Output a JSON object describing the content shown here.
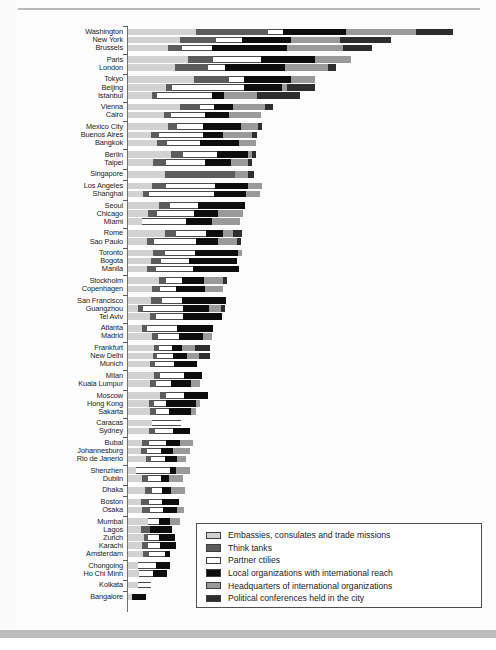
{
  "chart_data": {
    "type": "bar",
    "orientation": "horizontal",
    "stacked": true,
    "title": "",
    "subtitle": "",
    "xlabel": "",
    "ylabel": "",
    "grid": false,
    "axis_ticks_visible": false,
    "legend_position": "bottom-right",
    "series": [
      {
        "name": "Embassies, consulates and trade missions",
        "key": "s0",
        "color": "#d2d2d2"
      },
      {
        "name": "Think tanks",
        "key": "s1",
        "color": "#5c5c5c"
      },
      {
        "name": "Partner ctilies",
        "key": "s2",
        "color": "#ffffff"
      },
      {
        "name": "Local organizations with international reach",
        "key": "s3",
        "color": "#0d0d0d"
      },
      {
        "name": "Headquarters of international organizations",
        "key": "s4",
        "color": "#9a9a9a"
      },
      {
        "name": "Political conferences held in the city",
        "key": "s5",
        "color": "#2e2e2e"
      }
    ],
    "categories": [
      "Washington",
      "New York",
      "Brussels",
      "Paris",
      "London",
      "Tokyo",
      "Beijing",
      "Istanbul",
      "Vienna",
      "Cairo",
      "Mexico City",
      "Buenos Aires",
      "Bangkok",
      "Berlin",
      "Taipei",
      "Singapore",
      "Los Angeles",
      "Shanghai",
      "Seoul",
      "Chicago",
      "Miami",
      "Rome",
      "Sao Paulo",
      "Toronto",
      "Bogota",
      "Manila",
      "Stockholm",
      "Copenhagen",
      "San Francisco",
      "Guangzhou",
      "Tel Aviv",
      "Atlanta",
      "Madrid",
      "Frankfurt",
      "New Delhi",
      "Munich",
      "Milan",
      "Kuala Lumpur",
      "Moscow",
      "Hong Kong",
      "Sakarta",
      "Caracas",
      "Sydney",
      "Bubal",
      "Johannesburg",
      "Rio de Janerio",
      "Shenzhen",
      "Dublin",
      "Dhaka",
      "Boston",
      "Osaka",
      "Mumbai",
      "Lagos",
      "Zurich",
      "Karachi",
      "Amsterdam",
      "Chongoing",
      "Ho Chi Minh",
      "Kolkata",
      "Bangalore"
    ],
    "values": [
      [
        68,
        72,
        15,
        63,
        70,
        37
      ],
      [
        52,
        36,
        26,
        49,
        49,
        51
      ],
      [
        40,
        14,
        30,
        75,
        56,
        29
      ],
      [
        60,
        25,
        48,
        54,
        36,
        0
      ],
      [
        47,
        33,
        17,
        60,
        43,
        8
      ],
      [
        66,
        35,
        15,
        47,
        24,
        0
      ],
      [
        38,
        6,
        72,
        38,
        5,
        28
      ],
      [
        24,
        5,
        55,
        12,
        33,
        43
      ],
      [
        52,
        20,
        14,
        19,
        32,
        8
      ],
      [
        36,
        7,
        34,
        24,
        32,
        0
      ],
      [
        40,
        9,
        26,
        38,
        17,
        4
      ],
      [
        23,
        8,
        44,
        20,
        29,
        5
      ],
      [
        29,
        10,
        33,
        39,
        17,
        0
      ],
      [
        43,
        12,
        34,
        31,
        4,
        4
      ],
      [
        25,
        13,
        39,
        26,
        17,
        4
      ],
      [
        37,
        70,
        0,
        0,
        13,
        6
      ],
      [
        24,
        14,
        49,
        33,
        14,
        0
      ],
      [
        15,
        6,
        65,
        32,
        14,
        0
      ],
      [
        31,
        11,
        28,
        47,
        0,
        0
      ],
      [
        20,
        9,
        37,
        24,
        25,
        0
      ],
      [
        14,
        0,
        44,
        26,
        28,
        0
      ],
      [
        37,
        11,
        30,
        17,
        10,
        9
      ],
      [
        19,
        7,
        42,
        22,
        19,
        4
      ],
      [
        25,
        12,
        30,
        43,
        4,
        0
      ],
      [
        23,
        10,
        28,
        48,
        0,
        0
      ],
      [
        19,
        9,
        37,
        46,
        0,
        0
      ],
      [
        31,
        7,
        16,
        22,
        19,
        4
      ],
      [
        24,
        8,
        16,
        29,
        18,
        0
      ],
      [
        23,
        11,
        20,
        44,
        0,
        0
      ],
      [
        10,
        5,
        40,
        26,
        12,
        4
      ],
      [
        22,
        6,
        27,
        39,
        0,
        0
      ],
      [
        14,
        5,
        30,
        36,
        0,
        0
      ],
      [
        24,
        6,
        21,
        24,
        9,
        0
      ],
      [
        26,
        5,
        13,
        10,
        13,
        15
      ],
      [
        25,
        4,
        16,
        14,
        12,
        11
      ],
      [
        22,
        5,
        19,
        23,
        0,
        0
      ],
      [
        26,
        6,
        24,
        18,
        0,
        0
      ],
      [
        22,
        6,
        15,
        20,
        9,
        0
      ],
      [
        32,
        6,
        18,
        24,
        0,
        0
      ],
      [
        21,
        5,
        12,
        30,
        4,
        0
      ],
      [
        22,
        6,
        13,
        22,
        5,
        0
      ],
      [
        24,
        0,
        29,
        0,
        0,
        0
      ],
      [
        21,
        6,
        18,
        17,
        0,
        0
      ],
      [
        14,
        7,
        17,
        14,
        13,
        0
      ],
      [
        13,
        6,
        14,
        12,
        17,
        0
      ],
      [
        18,
        5,
        14,
        12,
        9,
        0
      ],
      [
        8,
        0,
        34,
        6,
        14,
        0
      ],
      [
        14,
        6,
        13,
        8,
        14,
        0
      ],
      [
        17,
        7,
        10,
        9,
        14,
        0
      ],
      [
        13,
        8,
        13,
        17,
        0,
        0
      ],
      [
        14,
        8,
        13,
        14,
        7,
        0
      ],
      [
        20,
        0,
        11,
        11,
        10,
        0
      ],
      [
        13,
        9,
        0,
        22,
        0,
        0
      ],
      [
        16,
        4,
        11,
        16,
        0,
        0
      ],
      [
        14,
        6,
        12,
        16,
        0,
        0
      ],
      [
        15,
        6,
        16,
        5,
        0,
        0
      ],
      [
        10,
        0,
        18,
        14,
        0,
        0
      ],
      [
        11,
        0,
        14,
        14,
        0,
        0
      ],
      [
        10,
        0,
        13,
        0,
        0,
        0
      ],
      [
        4,
        0,
        0,
        14,
        0,
        0
      ]
    ],
    "groups": [
      {
        "start": 0,
        "count": 3
      },
      {
        "start": 3,
        "count": 2
      },
      {
        "start": 5,
        "count": 3
      },
      {
        "start": 8,
        "count": 2
      },
      {
        "start": 10,
        "count": 3
      },
      {
        "start": 13,
        "count": 2
      },
      {
        "start": 15,
        "count": 1
      },
      {
        "start": 16,
        "count": 2
      },
      {
        "start": 18,
        "count": 3
      },
      {
        "start": 21,
        "count": 2
      },
      {
        "start": 23,
        "count": 3
      },
      {
        "start": 26,
        "count": 2
      },
      {
        "start": 28,
        "count": 3
      },
      {
        "start": 31,
        "count": 2
      },
      {
        "start": 33,
        "count": 3
      },
      {
        "start": 36,
        "count": 2
      },
      {
        "start": 38,
        "count": 3
      },
      {
        "start": 41,
        "count": 2
      },
      {
        "start": 43,
        "count": 3
      },
      {
        "start": 46,
        "count": 2
      },
      {
        "start": 48,
        "count": 1
      },
      {
        "start": 49,
        "count": 2
      },
      {
        "start": 51,
        "count": 5
      },
      {
        "start": 56,
        "count": 2
      },
      {
        "start": 58,
        "count": 1
      },
      {
        "start": 59,
        "count": 1
      }
    ]
  },
  "legend": {
    "items": [
      "Embassies, consulates and trade missions",
      "Think tanks",
      "Partner ctilies",
      "Local organizations with international reach",
      "Headquarters of international organizations",
      "Political conferences held in the city"
    ]
  }
}
